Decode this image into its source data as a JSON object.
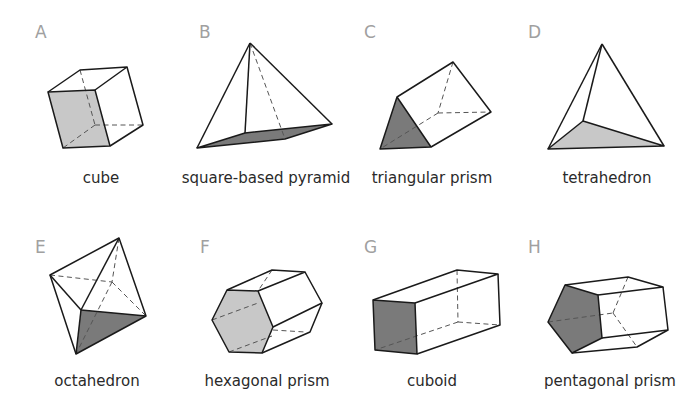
{
  "colors": {
    "light_face": "#c8c8c8",
    "dark_face": "#7a7a7a",
    "edge": "#1a1a1a",
    "letter": "#a0a0a0",
    "caption": "#2a2a2a"
  },
  "shapes": [
    {
      "letter": "A",
      "name": "cube",
      "face_shade": "light"
    },
    {
      "letter": "B",
      "name": "square-based pyramid",
      "face_shade": "dark"
    },
    {
      "letter": "C",
      "name": "triangular prism",
      "face_shade": "dark"
    },
    {
      "letter": "D",
      "name": "tetrahedron",
      "face_shade": "light"
    },
    {
      "letter": "E",
      "name": "octahedron",
      "face_shade": "dark"
    },
    {
      "letter": "F",
      "name": "hexagonal prism",
      "face_shade": "light"
    },
    {
      "letter": "G",
      "name": "cuboid",
      "face_shade": "dark"
    },
    {
      "letter": "H",
      "name": "pentagonal prism",
      "face_shade": "dark"
    }
  ]
}
